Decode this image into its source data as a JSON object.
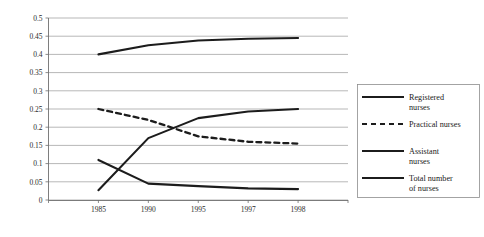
{
  "chart_data": {
    "type": "line",
    "title": "",
    "xlabel": "",
    "ylabel": "",
    "categories": [
      "1985",
      "1990",
      "1995",
      "1997",
      "1998"
    ],
    "ylim": [
      0,
      0.5
    ],
    "y_ticks": [
      "0",
      "0.05",
      "0.1",
      "0.15",
      "0.2",
      "0.25",
      "0.3",
      "0.35",
      "0.4",
      "0.45",
      "0.5"
    ],
    "y_tick_values": [
      0,
      0.05,
      0.1,
      0.15,
      0.2,
      0.25,
      0.3,
      0.35,
      0.4,
      0.45,
      0.5
    ],
    "grid": true,
    "legend_position": "right",
    "series": [
      {
        "name": "Registered nurses",
        "style": "solid",
        "color": "#1c1c1c",
        "values": [
          0.11,
          0.045,
          0.038,
          0.032,
          0.03
        ]
      },
      {
        "name": "Practical nurses",
        "style": "dashed",
        "color": "#1c1c1c",
        "values": [
          0.25,
          0.22,
          0.175,
          0.16,
          0.155
        ]
      },
      {
        "name": "Assistant nurses",
        "style": "solid",
        "color": "#1c1c1c",
        "values": [
          0.027,
          0.17,
          0.225,
          0.243,
          0.25
        ]
      },
      {
        "name": "Total number of nurses",
        "style": "solid",
        "color": "#1c1c1c",
        "values": [
          0.4,
          0.425,
          0.438,
          0.443,
          0.445
        ]
      }
    ]
  },
  "legend": {
    "items": [
      {
        "label_line1": "Registered",
        "label_line2": "nurses",
        "style": "solid"
      },
      {
        "label_line1": "Practical nurses",
        "label_line2": "",
        "style": "dashed"
      },
      {
        "label_line1": "Assistant",
        "label_line2": "nurses",
        "style": "solid"
      },
      {
        "label_line1": "Total number",
        "label_line2": "of nurses",
        "style": "solid"
      }
    ]
  }
}
